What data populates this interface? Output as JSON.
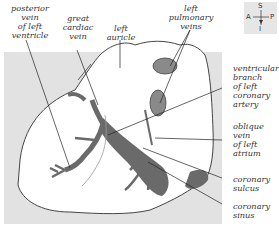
{
  "figure": {
    "labels": {
      "posterior_vein": "posterior\nvein\nof left\nventricle",
      "great_cardiac_vein": "great\ncardiac\nvein",
      "left_auricle": "left\nauricle",
      "left_pulmonary_veins": "left\npulmonary\nveins",
      "ventricular_branch": "ventricular\nbranch\nof left\ncoronary\nartery",
      "oblique_vein": "oblique\nvein\nof left\natrium",
      "coronary_sulcus": "coronary\nsulcus",
      "coronary_sinus": "coronary\nsinus"
    },
    "orientation": {
      "superior": "S",
      "inferior": "I",
      "anterior": "A",
      "posterior": "P"
    },
    "colors": {
      "background_panel": "#e2e2e2",
      "vessel": "#6a6a6a",
      "heart": "#ffffff",
      "outline": "#444444"
    }
  }
}
